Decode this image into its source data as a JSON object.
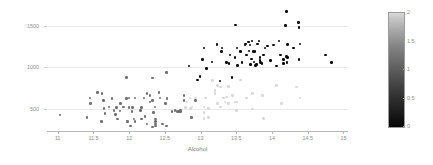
{
  "chart_data": {
    "type": "scatter",
    "title": "",
    "xlabel": "Alcohol",
    "ylabel": "Proline",
    "xlim": [
      10.85,
      15.05
    ],
    "ylim": [
      240,
      1720
    ],
    "xticks": [
      "11",
      "11.5",
      "12",
      "12.5",
      "13",
      "13.5",
      "14",
      "14.5",
      "15"
    ],
    "xtick_values": [
      11,
      11.5,
      12,
      12.5,
      13,
      13.5,
      14,
      14.5,
      15
    ],
    "yticks": [
      "500",
      "1000",
      "1500"
    ],
    "ytick_values": [
      500,
      1000,
      1500
    ],
    "grid": "horizontal",
    "colorbar": {
      "label": "",
      "min": 0,
      "max": 2,
      "ticks": [
        "0",
        "0.5",
        "1",
        "1.5",
        "2"
      ],
      "tick_values": [
        0,
        0.5,
        1,
        1.5,
        2
      ],
      "colormap": "gray",
      "low_color": "#050505",
      "high_color": "#d8d8d8",
      "position": "right"
    },
    "color_variable": "class",
    "marker_size": 2.6,
    "points": [
      {
        "x": 11.03,
        "y": 420,
        "c": 1
      },
      {
        "x": 11.45,
        "y": 630,
        "c": 1
      },
      {
        "x": 11.41,
        "y": 392,
        "c": 1
      },
      {
        "x": 11.46,
        "y": 562,
        "c": 1
      },
      {
        "x": 11.56,
        "y": 695,
        "c": 1
      },
      {
        "x": 11.62,
        "y": 680,
        "c": 1
      },
      {
        "x": 11.64,
        "y": 600,
        "c": 1
      },
      {
        "x": 11.61,
        "y": 345,
        "c": 1
      },
      {
        "x": 11.65,
        "y": 500,
        "c": 1
      },
      {
        "x": 11.66,
        "y": 438,
        "c": 1
      },
      {
        "x": 11.72,
        "y": 520,
        "c": 1
      },
      {
        "x": 11.76,
        "y": 625,
        "c": 1
      },
      {
        "x": 11.79,
        "y": 480,
        "c": 1
      },
      {
        "x": 11.81,
        "y": 430,
        "c": 1
      },
      {
        "x": 11.82,
        "y": 510,
        "c": 1
      },
      {
        "x": 11.84,
        "y": 372,
        "c": 1
      },
      {
        "x": 11.87,
        "y": 470,
        "c": 1
      },
      {
        "x": 11.88,
        "y": 560,
        "c": 1
      },
      {
        "x": 11.92,
        "y": 520,
        "c": 1
      },
      {
        "x": 11.96,
        "y": 880,
        "c": 1
      },
      {
        "x": 11.96,
        "y": 620,
        "c": 1
      },
      {
        "x": 11.98,
        "y": 345,
        "c": 1
      },
      {
        "x": 12.0,
        "y": 510,
        "c": 1
      },
      {
        "x": 12.0,
        "y": 630,
        "c": 1
      },
      {
        "x": 12.02,
        "y": 290,
        "c": 1
      },
      {
        "x": 12.04,
        "y": 466,
        "c": 1
      },
      {
        "x": 12.05,
        "y": 510,
        "c": 1
      },
      {
        "x": 12.07,
        "y": 372,
        "c": 1
      },
      {
        "x": 12.08,
        "y": 630,
        "c": 1
      },
      {
        "x": 12.08,
        "y": 345,
        "c": 1
      },
      {
        "x": 12.16,
        "y": 480,
        "c": 1
      },
      {
        "x": 12.17,
        "y": 372,
        "c": 1
      },
      {
        "x": 12.17,
        "y": 510,
        "c": 1
      },
      {
        "x": 12.21,
        "y": 630,
        "c": 1
      },
      {
        "x": 12.22,
        "y": 406,
        "c": 1
      },
      {
        "x": 12.25,
        "y": 312,
        "c": 1
      },
      {
        "x": 12.25,
        "y": 680,
        "c": 1
      },
      {
        "x": 12.29,
        "y": 580,
        "c": 1
      },
      {
        "x": 12.29,
        "y": 660,
        "c": 1
      },
      {
        "x": 12.33,
        "y": 600,
        "c": 1
      },
      {
        "x": 12.33,
        "y": 870,
        "c": 1
      },
      {
        "x": 12.33,
        "y": 278,
        "c": 1
      },
      {
        "x": 12.34,
        "y": 450,
        "c": 1
      },
      {
        "x": 12.36,
        "y": 520,
        "c": 1
      },
      {
        "x": 12.37,
        "y": 345,
        "c": 1
      },
      {
        "x": 12.37,
        "y": 290,
        "c": 1
      },
      {
        "x": 12.37,
        "y": 372,
        "c": 1
      },
      {
        "x": 12.37,
        "y": 312,
        "c": 1
      },
      {
        "x": 12.42,
        "y": 695,
        "c": 1
      },
      {
        "x": 12.43,
        "y": 630,
        "c": 1
      },
      {
        "x": 12.47,
        "y": 312,
        "c": 1
      },
      {
        "x": 12.51,
        "y": 560,
        "c": 1
      },
      {
        "x": 12.52,
        "y": 290,
        "c": 1
      },
      {
        "x": 12.52,
        "y": 940,
        "c": 1
      },
      {
        "x": 12.53,
        "y": 625,
        "c": 1
      },
      {
        "x": 12.6,
        "y": 466,
        "c": 1
      },
      {
        "x": 12.64,
        "y": 480,
        "c": 1
      },
      {
        "x": 12.67,
        "y": 468,
        "c": 1
      },
      {
        "x": 12.69,
        "y": 466,
        "c": 1
      },
      {
        "x": 12.7,
        "y": 470,
        "c": 1
      },
      {
        "x": 12.72,
        "y": 478,
        "c": 1
      },
      {
        "x": 12.72,
        "y": 462,
        "c": 1
      },
      {
        "x": 12.77,
        "y": 600,
        "c": 1
      },
      {
        "x": 12.77,
        "y": 660,
        "c": 1
      },
      {
        "x": 12.79,
        "y": 515,
        "c": 2
      },
      {
        "x": 12.81,
        "y": 580,
        "c": 2
      },
      {
        "x": 12.84,
        "y": 1015,
        "c": 0
      },
      {
        "x": 12.85,
        "y": 630,
        "c": 2
      },
      {
        "x": 12.86,
        "y": 500,
        "c": 2
      },
      {
        "x": 12.87,
        "y": 392,
        "c": 1
      },
      {
        "x": 12.88,
        "y": 520,
        "c": 2
      },
      {
        "x": 12.93,
        "y": 600,
        "c": 1
      },
      {
        "x": 12.93,
        "y": 630,
        "c": 2
      },
      {
        "x": 12.96,
        "y": 845,
        "c": 0
      },
      {
        "x": 12.99,
        "y": 886,
        "c": 0
      },
      {
        "x": 13.03,
        "y": 1095,
        "c": 0
      },
      {
        "x": 13.05,
        "y": 1235,
        "c": 0
      },
      {
        "x": 13.05,
        "y": 520,
        "c": 2
      },
      {
        "x": 13.05,
        "y": 450,
        "c": 2
      },
      {
        "x": 13.05,
        "y": 380,
        "c": 2
      },
      {
        "x": 13.07,
        "y": 630,
        "c": 2
      },
      {
        "x": 13.08,
        "y": 985,
        "c": 0
      },
      {
        "x": 13.11,
        "y": 392,
        "c": 2
      },
      {
        "x": 13.11,
        "y": 502,
        "c": 2
      },
      {
        "x": 13.16,
        "y": 1065,
        "c": 0
      },
      {
        "x": 13.17,
        "y": 840,
        "c": 2
      },
      {
        "x": 13.2,
        "y": 680,
        "c": 2
      },
      {
        "x": 13.2,
        "y": 718,
        "c": 2
      },
      {
        "x": 13.23,
        "y": 1280,
        "c": 0
      },
      {
        "x": 13.24,
        "y": 780,
        "c": 2
      },
      {
        "x": 13.24,
        "y": 560,
        "c": 2
      },
      {
        "x": 13.27,
        "y": 835,
        "c": 0
      },
      {
        "x": 13.28,
        "y": 760,
        "c": 2
      },
      {
        "x": 13.28,
        "y": 520,
        "c": 2
      },
      {
        "x": 13.29,
        "y": 1190,
        "c": 0
      },
      {
        "x": 13.3,
        "y": 1235,
        "c": 0
      },
      {
        "x": 13.32,
        "y": 630,
        "c": 2
      },
      {
        "x": 13.34,
        "y": 580,
        "c": 2
      },
      {
        "x": 13.36,
        "y": 1060,
        "c": 0
      },
      {
        "x": 13.36,
        "y": 640,
        "c": 2
      },
      {
        "x": 13.39,
        "y": 770,
        "c": 2
      },
      {
        "x": 13.39,
        "y": 560,
        "c": 2
      },
      {
        "x": 13.4,
        "y": 1050,
        "c": 0
      },
      {
        "x": 13.41,
        "y": 1150,
        "c": 0
      },
      {
        "x": 13.44,
        "y": 880,
        "c": 0
      },
      {
        "x": 13.45,
        "y": 660,
        "c": 2
      },
      {
        "x": 13.48,
        "y": 1120,
        "c": 0
      },
      {
        "x": 13.49,
        "y": 1515,
        "c": 0
      },
      {
        "x": 13.49,
        "y": 580,
        "c": 2
      },
      {
        "x": 13.5,
        "y": 480,
        "c": 2
      },
      {
        "x": 13.5,
        "y": 580,
        "c": 2
      },
      {
        "x": 13.51,
        "y": 1235,
        "c": 0
      },
      {
        "x": 13.52,
        "y": 1020,
        "c": 0
      },
      {
        "x": 13.56,
        "y": 845,
        "c": 2
      },
      {
        "x": 13.56,
        "y": 1195,
        "c": 0
      },
      {
        "x": 13.58,
        "y": 1060,
        "c": 0
      },
      {
        "x": 13.62,
        "y": 1270,
        "c": 0
      },
      {
        "x": 13.63,
        "y": 1285,
        "c": 0
      },
      {
        "x": 13.64,
        "y": 1150,
        "c": 0
      },
      {
        "x": 13.64,
        "y": 630,
        "c": 2
      },
      {
        "x": 13.67,
        "y": 1310,
        "c": 0
      },
      {
        "x": 13.68,
        "y": 1200,
        "c": 0
      },
      {
        "x": 13.69,
        "y": 1270,
        "c": 0
      },
      {
        "x": 13.7,
        "y": 1035,
        "c": 0
      },
      {
        "x": 13.71,
        "y": 1100,
        "c": 0
      },
      {
        "x": 13.72,
        "y": 1320,
        "c": 0
      },
      {
        "x": 13.73,
        "y": 680,
        "c": 2
      },
      {
        "x": 13.73,
        "y": 495,
        "c": 2
      },
      {
        "x": 13.74,
        "y": 1190,
        "c": 0
      },
      {
        "x": 13.75,
        "y": 1065,
        "c": 0
      },
      {
        "x": 13.76,
        "y": 1195,
        "c": 0
      },
      {
        "x": 13.77,
        "y": 1025,
        "c": 0
      },
      {
        "x": 13.78,
        "y": 1035,
        "c": 0
      },
      {
        "x": 13.8,
        "y": 1285,
        "c": 0
      },
      {
        "x": 13.82,
        "y": 1320,
        "c": 0
      },
      {
        "x": 13.83,
        "y": 1080,
        "c": 0
      },
      {
        "x": 13.83,
        "y": 1120,
        "c": 0
      },
      {
        "x": 13.84,
        "y": 1060,
        "c": 0
      },
      {
        "x": 13.86,
        "y": 1045,
        "c": 0
      },
      {
        "x": 13.87,
        "y": 660,
        "c": 2
      },
      {
        "x": 13.88,
        "y": 380,
        "c": 2
      },
      {
        "x": 13.88,
        "y": 1150,
        "c": 0
      },
      {
        "x": 13.9,
        "y": 1235,
        "c": 0
      },
      {
        "x": 13.94,
        "y": 1260,
        "c": 0
      },
      {
        "x": 13.98,
        "y": 1080,
        "c": 0
      },
      {
        "x": 14.02,
        "y": 1270,
        "c": 0
      },
      {
        "x": 14.06,
        "y": 1015,
        "c": 0
      },
      {
        "x": 14.06,
        "y": 780,
        "c": 2
      },
      {
        "x": 14.1,
        "y": 1320,
        "c": 0
      },
      {
        "x": 14.12,
        "y": 1150,
        "c": 0
      },
      {
        "x": 14.13,
        "y": 560,
        "c": 2
      },
      {
        "x": 14.16,
        "y": 1045,
        "c": 0
      },
      {
        "x": 14.16,
        "y": 1095,
        "c": 0
      },
      {
        "x": 14.19,
        "y": 1510,
        "c": 0
      },
      {
        "x": 14.2,
        "y": 1680,
        "c": 0
      },
      {
        "x": 14.2,
        "y": 1130,
        "c": 0
      },
      {
        "x": 14.21,
        "y": 1060,
        "c": 0
      },
      {
        "x": 14.22,
        "y": 1280,
        "c": 0
      },
      {
        "x": 14.22,
        "y": 1120,
        "c": 0
      },
      {
        "x": 14.3,
        "y": 1235,
        "c": 0
      },
      {
        "x": 14.34,
        "y": 760,
        "c": 2
      },
      {
        "x": 14.37,
        "y": 1547,
        "c": 0
      },
      {
        "x": 14.38,
        "y": 1480,
        "c": 0
      },
      {
        "x": 14.38,
        "y": 1095,
        "c": 0
      },
      {
        "x": 14.39,
        "y": 1285,
        "c": 0
      },
      {
        "x": 14.39,
        "y": 630,
        "c": 2
      },
      {
        "x": 14.75,
        "y": 1150,
        "c": 0
      },
      {
        "x": 14.83,
        "y": 1060,
        "c": 0
      }
    ]
  }
}
